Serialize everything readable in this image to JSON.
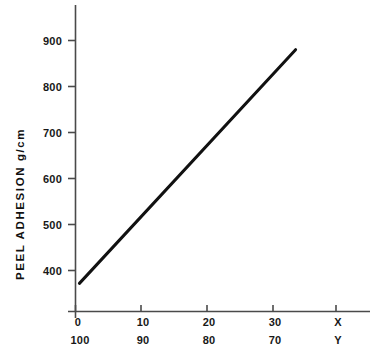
{
  "chart_data": {
    "type": "line",
    "title": "",
    "subtitle": "",
    "ylabel": "PEEL   ADHESION    g/cm",
    "xlabel": "",
    "grid": false,
    "legend": null,
    "xlim": [
      -1,
      38
    ],
    "ylim": [
      330,
      960
    ],
    "x_axes": [
      {
        "name": "X",
        "ticks": [
          0,
          10,
          20,
          30
        ],
        "tick_labels": [
          "0",
          "10",
          "20",
          "30"
        ],
        "axis_name_label": "X"
      },
      {
        "name": "Y",
        "ticks": [
          0,
          10,
          20,
          30
        ],
        "tick_labels": [
          "100",
          "90",
          "80",
          "70"
        ],
        "axis_name_label": "Y"
      }
    ],
    "y_ticks": [
      400,
      500,
      600,
      700,
      800,
      900
    ],
    "y_tick_labels": [
      "400",
      "500",
      "600",
      "700",
      "800",
      "900"
    ],
    "series": [
      {
        "name": "peel adhesion",
        "color": "#111111",
        "line_width": 3,
        "points": [
          {
            "x": 0.6,
            "y": 372
          },
          {
            "x": 33.6,
            "y": 880
          }
        ]
      }
    ],
    "axis_color": "#4a4a4a",
    "line_color": "#111111",
    "background": "#ffffff"
  }
}
